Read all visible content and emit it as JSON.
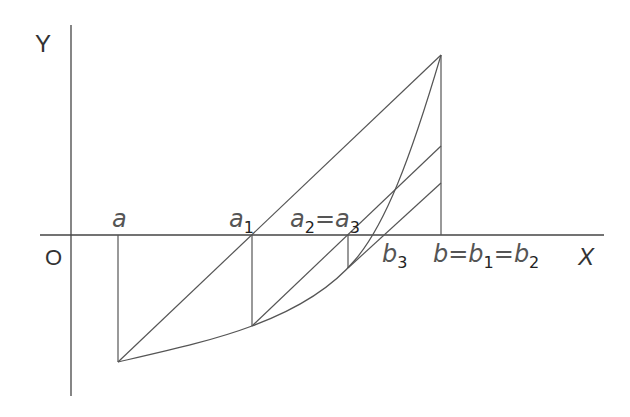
{
  "diagram": {
    "axes": {
      "x_label": "X",
      "y_label": "Y",
      "origin_label": "O"
    },
    "points": {
      "a": "a",
      "a1": "a",
      "a1_sub": "1",
      "a2": "a",
      "a2_sub": "2",
      "eq1": "=",
      "a3": "a",
      "a3_sub": "3",
      "b3": "b",
      "b3_sub": "3",
      "b": "b",
      "eq2": "=",
      "b1": "b",
      "b1_sub": "1",
      "eq3": "=",
      "b2": "b",
      "b2_sub": "2"
    },
    "colors": {
      "line": "#555555",
      "background": "#ffffff"
    }
  }
}
